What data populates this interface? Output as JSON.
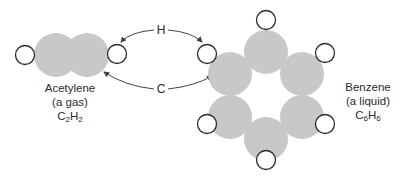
{
  "colors": {
    "carbon_fill": "#c8c8c8",
    "hydrogen_stroke": "#2a2a2a",
    "arrow": "#444444",
    "text": "#2a2a2a"
  },
  "acetylene": {
    "name": "Acetylene",
    "state": "(a gas)",
    "formula_c": "C",
    "formula_c_sub": "2",
    "formula_h": "H",
    "formula_h_sub": "2"
  },
  "benzene": {
    "name": "Benzene",
    "state": "(a liquid)",
    "formula_c": "C",
    "formula_c_sub": "6",
    "formula_h": "H",
    "formula_h_sub": "6"
  },
  "arrows": {
    "top_label": "H",
    "bottom_label": "C"
  }
}
